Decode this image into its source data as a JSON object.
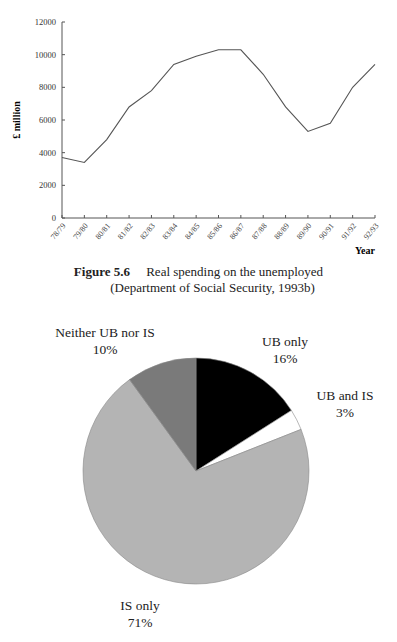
{
  "figure1": {
    "caption_number": "Figure 5.6",
    "caption_title": "Real spending on the unemployed",
    "caption_source": "(Department of Social Security, 1993b)"
  },
  "figure2": {
    "labels": {
      "neither": "Neither UB nor IS",
      "neither_pct": "10%",
      "ub_only": "UB only",
      "ub_only_pct": "16%",
      "ub_and_is": "UB and IS",
      "ub_and_is_pct": "3%",
      "is_only": "IS only",
      "is_only_pct": "71%"
    }
  },
  "chart_data": [
    {
      "type": "line",
      "title": "Real spending on the unemployed",
      "xlabel": "Year",
      "ylabel": "£ million",
      "ylim": [
        0,
        12000
      ],
      "yticks": [
        0,
        2000,
        4000,
        6000,
        8000,
        10000,
        12000
      ],
      "grid": false,
      "categories": [
        "78/79",
        "79/80",
        "80/81",
        "81/82",
        "82/83",
        "83/84",
        "84/85",
        "85/86",
        "86/87",
        "87/88",
        "88/89",
        "89/90",
        "90/91",
        "91/92",
        "92/93"
      ],
      "series": [
        {
          "name": "Real spending",
          "values": [
            3700,
            3400,
            4800,
            6800,
            7800,
            9400,
            9900,
            10300,
            10300,
            8800,
            6800,
            5300,
            5800,
            8000,
            9400
          ]
        }
      ],
      "colors": {
        "line": "#555555",
        "axis": "#555555"
      }
    },
    {
      "type": "pie",
      "categories": [
        "UB only",
        "UB and IS",
        "IS only",
        "Neither UB nor IS"
      ],
      "values": [
        16,
        3,
        71,
        10
      ],
      "value_labels": [
        "16%",
        "3%",
        "71%",
        "10%"
      ],
      "colors": [
        "#000000",
        "#ffffff",
        "#b4b4b4",
        "#7a7a7a"
      ],
      "start_angle": "12 o'clock, clockwise",
      "legend": "none (direct labels)"
    }
  ]
}
